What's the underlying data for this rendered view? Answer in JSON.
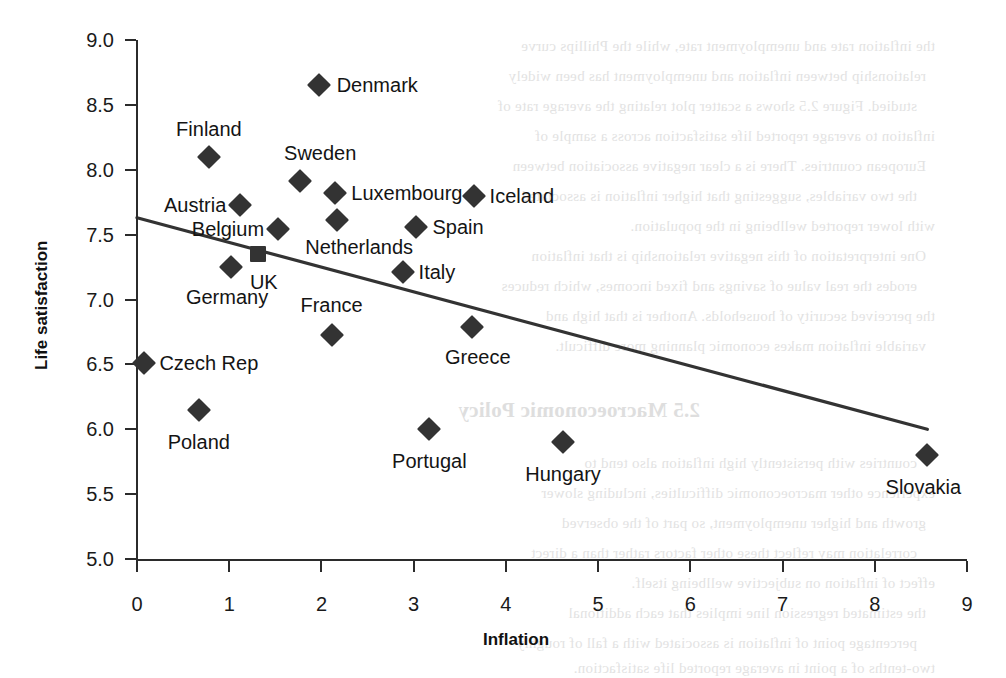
{
  "chart_data": {
    "type": "scatter",
    "title": "",
    "xlabel": "Inflation",
    "ylabel": "Life satisfaction",
    "xlim": [
      0,
      9
    ],
    "ylim": [
      5.0,
      9.0
    ],
    "xticks": [
      "0",
      "1",
      "2",
      "3",
      "4",
      "5",
      "6",
      "7",
      "8",
      "9"
    ],
    "yticks": [
      "5.0",
      "5.5",
      "6.0",
      "6.5",
      "7.0",
      "7.5",
      "8.0",
      "8.5",
      "9.0"
    ],
    "grid": false,
    "legend": "none",
    "marker_color": "#333333",
    "line_color": "#333333",
    "points": [
      {
        "label": "Denmark",
        "x": 1.97,
        "y": 8.65,
        "marker": "diamond",
        "label_side": "right",
        "label_dx": 18,
        "label_dy": 0
      },
      {
        "label": "Finland",
        "x": 0.78,
        "y": 8.1,
        "marker": "diamond",
        "label_side": "center",
        "label_dx": 0,
        "label_dy": -28
      },
      {
        "label": "Sweden",
        "x": 1.77,
        "y": 7.91,
        "marker": "diamond",
        "label_side": "center",
        "label_dx": 20,
        "label_dy": -28
      },
      {
        "label": "Austria",
        "x": 1.12,
        "y": 7.73,
        "marker": "diamond",
        "label_side": "left",
        "label_dx": -14,
        "label_dy": 0
      },
      {
        "label": "Luxembourg",
        "x": 2.15,
        "y": 7.82,
        "marker": "diamond",
        "label_side": "right",
        "label_dx": 16,
        "label_dy": 0
      },
      {
        "label": "Iceland",
        "x": 3.65,
        "y": 7.8,
        "marker": "diamond",
        "label_side": "right",
        "label_dx": 16,
        "label_dy": 0
      },
      {
        "label": "Belgium",
        "x": 1.53,
        "y": 7.54,
        "marker": "diamond",
        "label_side": "left",
        "label_dx": -14,
        "label_dy": 0
      },
      {
        "label": "Netherlands",
        "x": 2.17,
        "y": 7.61,
        "marker": "diamond",
        "label_side": "center",
        "label_dx": 22,
        "label_dy": 27
      },
      {
        "label": "Spain",
        "x": 3.03,
        "y": 7.56,
        "marker": "diamond",
        "label_side": "right",
        "label_dx": 16,
        "label_dy": 0
      },
      {
        "label": "UK",
        "x": 1.31,
        "y": 7.35,
        "marker": "square",
        "label_side": "center",
        "label_dx": 6,
        "label_dy": 28
      },
      {
        "label": "Germany",
        "x": 1.02,
        "y": 7.25,
        "marker": "diamond",
        "label_side": "center",
        "label_dx": -4,
        "label_dy": 30
      },
      {
        "label": "Italy",
        "x": 2.88,
        "y": 7.21,
        "marker": "diamond",
        "label_side": "right",
        "label_dx": 16,
        "label_dy": 0
      },
      {
        "label": "France",
        "x": 2.11,
        "y": 6.73,
        "marker": "diamond",
        "label_side": "center",
        "label_dx": 0,
        "label_dy": -30
      },
      {
        "label": "Greece",
        "x": 3.63,
        "y": 6.79,
        "marker": "diamond",
        "label_side": "center",
        "label_dx": 6,
        "label_dy": 30
      },
      {
        "label": "Czech Rep",
        "x": 0.08,
        "y": 6.51,
        "marker": "diamond",
        "label_side": "right",
        "label_dx": 15,
        "label_dy": 0
      },
      {
        "label": "Poland",
        "x": 0.67,
        "y": 6.15,
        "marker": "diamond",
        "label_side": "center",
        "label_dx": 0,
        "label_dy": 32
      },
      {
        "label": "Portugal",
        "x": 3.17,
        "y": 6.0,
        "marker": "diamond",
        "label_side": "center",
        "label_dx": 0,
        "label_dy": 32
      },
      {
        "label": "Hungary",
        "x": 4.62,
        "y": 5.9,
        "marker": "diamond",
        "label_side": "center",
        "label_dx": 0,
        "label_dy": 32
      },
      {
        "label": "Slovakia",
        "x": 8.57,
        "y": 5.8,
        "marker": "diamond",
        "label_side": "center",
        "label_dx": -4,
        "label_dy": 32
      }
    ],
    "trendline": {
      "type": "linear-fit",
      "x0": 0.0,
      "y0": 7.63,
      "x1": 8.57,
      "y1": 6.0
    }
  },
  "background_bleed": {
    "heading": "2.5 Macroeconomic Policy",
    "lines": [
      "the inflation rate and unemployment rate, while the Phillips curve",
      "relationship between inflation and unemployment has been widely",
      "studied. Figure 2.5 shows a scatter plot relating the average rate of",
      "inflation to average reported life satisfaction across a sample of",
      "European countries. There is a clear negative association between",
      "the two variables, suggesting that higher inflation is associated",
      "with lower reported wellbeing in the population.",
      "One interpretation of this negative relationship is that inflation",
      "erodes the real value of savings and fixed incomes, which reduces",
      "the perceived security of households. Another is that high and",
      "variable inflation makes economic planning more difficult.",
      "countries with persistently high inflation also tend to",
      "experience other macroeconomic difficulties, including slower",
      "growth and higher unemployment, so part of the observed",
      "correlation may reflect these other factors rather than a direct",
      "effect of inflation on subjective wellbeing itself.",
      "the estimated regression line implies that each additional",
      "percentage point of inflation is associated with a fall of roughly",
      "two-tenths of a point in average reported life satisfaction."
    ]
  }
}
